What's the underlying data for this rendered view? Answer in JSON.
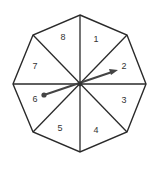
{
  "spinner": {
    "shape": "octagon",
    "line_color": "#2a2a2a",
    "arrow_color": "#444444",
    "sections": [
      {
        "label": "1",
        "x": 96,
        "y": 40
      },
      {
        "label": "2",
        "x": 124,
        "y": 67
      },
      {
        "label": "3",
        "x": 124,
        "y": 101
      },
      {
        "label": "4",
        "x": 96,
        "y": 131
      },
      {
        "label": "5",
        "x": 60,
        "y": 129
      },
      {
        "label": "6",
        "x": 35,
        "y": 100
      },
      {
        "label": "7",
        "x": 35,
        "y": 67
      },
      {
        "label": "8",
        "x": 63,
        "y": 38
      }
    ],
    "arrow": {
      "pointing_to": "2"
    }
  }
}
